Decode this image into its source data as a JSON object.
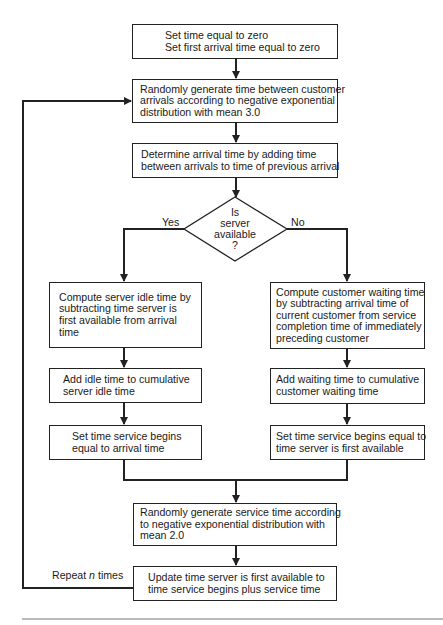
{
  "flowchart": {
    "start": {
      "lines": [
        "Set time equal to zero",
        "Set first arrival time equal to zero"
      ]
    },
    "generate_interarrival": {
      "lines": [
        "Randomly generate time between customer",
        "arrivals according to negative exponential",
        "distribution with mean 3.0"
      ]
    },
    "determine_arrival": {
      "lines": [
        "Determine arrival time by adding time",
        "between arrivals to time of previous arrival"
      ]
    },
    "decision": {
      "lines": [
        "Is",
        "server",
        "available",
        "?"
      ],
      "yes_label": "Yes",
      "no_label": "No"
    },
    "yes_branch": {
      "idle_time": {
        "lines": [
          "Compute server idle time by",
          "subtracting time server is",
          "first available from arrival",
          "time"
        ]
      },
      "add_idle": {
        "lines": [
          "Add idle time to cumulative",
          "server idle time"
        ]
      },
      "set_service_begins": {
        "lines": [
          "Set time service begins",
          "equal to arrival time"
        ]
      }
    },
    "no_branch": {
      "waiting_time": {
        "lines": [
          "Compute customer waiting time",
          "by subtracting arrival time of",
          "current customer from service",
          "completion time of immediately",
          "preceding customer"
        ]
      },
      "add_waiting": {
        "lines": [
          "Add waiting time to cumulative",
          "customer waiting time"
        ]
      },
      "set_service_begins": {
        "lines": [
          "Set time service begins equal to",
          "time server is first available"
        ]
      }
    },
    "generate_service": {
      "lines": [
        "Randomly generate service time according",
        "to negative exponential distribution with",
        "mean 2.0"
      ]
    },
    "update_server": {
      "lines": [
        "Update time server is first available to",
        "time service begins plus service time"
      ]
    },
    "loop_label": {
      "prefix": "Repeat ",
      "variable": "n",
      "suffix": " times"
    }
  }
}
